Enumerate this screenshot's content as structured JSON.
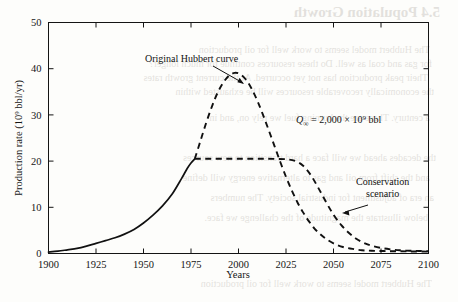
{
  "page": {
    "width": 458,
    "height": 302,
    "background_color": "#fdfdfb",
    "ink_color": "#121212"
  },
  "bleed_through": {
    "description": "faint mirrored text showing through from the opposite page of the scanned book",
    "heading": "5.4  Population Growth",
    "lines": [
      "The Hubbert model seems to work well for oil production",
      "for gas and coal as well. Do these resources continue for much longer?",
      "Their peak production has not yet occurred. At the current growth rates",
      "the economically recoverable resources will be exhausted within",
      "a century. These are the burning fuel we rely on, and in",
      "the decades ahead we will face a hard transition to new sources",
      "and the shift from oil and gas to alternative energy will define",
      "an era of adjustment for industrial society. The numbers",
      "below illustrate the magnitude of the challenge we face."
    ]
  },
  "chart_data": {
    "type": "line",
    "title": "",
    "xlabel": "Years",
    "ylabel": "Production rate (10⁹ bbl/yr)",
    "ylabel_parts": {
      "prefix": "Production rate (10",
      "exponent": "9",
      "suffix": " bbl/yr)"
    },
    "xlim": [
      1900,
      2100
    ],
    "ylim": [
      0,
      50
    ],
    "xticks": [
      1900,
      1925,
      1950,
      1975,
      2000,
      2025,
      2050,
      2075,
      2100
    ],
    "yticks": [
      0,
      10,
      20,
      30,
      40,
      50
    ],
    "grid": false,
    "legend_position": "inline-annotations",
    "annotations": [
      {
        "name": "original-hubbert-curve-label",
        "text": "Original Hubbert curve",
        "x_px": 145,
        "y_px": 62,
        "leader_to_px": [
          244,
          84
        ]
      },
      {
        "name": "conservation-scenario-label",
        "line1": "Conservation",
        "line2": "scenario",
        "x_px": 356,
        "y_px": 185,
        "leader_to_px": [
          343,
          208
        ]
      },
      {
        "name": "ultimate-recoverable-resource",
        "symbol": "Q",
        "subscript": "∞",
        "equals": "=",
        "value": "2,000",
        "times": "×",
        "base": "10",
        "exponent": "9",
        "unit": "bbl",
        "full_text": "Q∞ = 2,000 × 10⁹ bbl",
        "x_px": 296,
        "y_px": 122
      }
    ],
    "series": [
      {
        "name": "Historical production",
        "style": "solid",
        "color": "#111111",
        "points": [
          [
            1900,
            0.3
          ],
          [
            1905,
            0.5
          ],
          [
            1910,
            0.8
          ],
          [
            1915,
            1.1
          ],
          [
            1920,
            1.6
          ],
          [
            1925,
            2.2
          ],
          [
            1930,
            2.8
          ],
          [
            1935,
            3.4
          ],
          [
            1940,
            4.2
          ],
          [
            1945,
            5.2
          ],
          [
            1950,
            6.6
          ],
          [
            1955,
            8.3
          ],
          [
            1960,
            10.3
          ],
          [
            1965,
            12.8
          ],
          [
            1970,
            16.2
          ],
          [
            1973,
            18.4
          ],
          [
            1975,
            19.6
          ],
          [
            1977,
            20.5
          ]
        ]
      },
      {
        "name": "Original Hubbert curve",
        "style": "dashed",
        "color": "#111111",
        "points": [
          [
            1977,
            20.5
          ],
          [
            1980,
            24.4
          ],
          [
            1983,
            28.3
          ],
          [
            1986,
            31.8
          ],
          [
            1989,
            34.8
          ],
          [
            1992,
            37.0
          ],
          [
            1995,
            38.5
          ],
          [
            1998,
            39.1
          ],
          [
            2001,
            38.8
          ],
          [
            2004,
            37.6
          ],
          [
            2007,
            35.6
          ],
          [
            2010,
            33.0
          ],
          [
            2013,
            29.9
          ],
          [
            2016,
            26.6
          ],
          [
            2019,
            23.2
          ],
          [
            2022,
            19.8
          ],
          [
            2025,
            16.6
          ],
          [
            2028,
            13.7
          ],
          [
            2031,
            11.1
          ],
          [
            2034,
            8.9
          ],
          [
            2037,
            7.0
          ],
          [
            2040,
            5.4
          ],
          [
            2043,
            4.2
          ],
          [
            2046,
            3.2
          ],
          [
            2050,
            2.2
          ],
          [
            2055,
            1.4
          ],
          [
            2060,
            1.0
          ],
          [
            2065,
            0.7
          ],
          [
            2070,
            0.6
          ],
          [
            2080,
            0.5
          ],
          [
            2090,
            0.45
          ],
          [
            2100,
            0.4
          ]
        ]
      },
      {
        "name": "Conservation scenario",
        "style": "dashed",
        "color": "#111111",
        "points": [
          [
            1977,
            20.5
          ],
          [
            1985,
            20.5
          ],
          [
            1995,
            20.5
          ],
          [
            2005,
            20.5
          ],
          [
            2015,
            20.5
          ],
          [
            2025,
            20.4
          ],
          [
            2030,
            20.0
          ],
          [
            2034,
            19.0
          ],
          [
            2038,
            17.0
          ],
          [
            2042,
            14.2
          ],
          [
            2046,
            11.2
          ],
          [
            2050,
            8.4
          ],
          [
            2054,
            6.2
          ],
          [
            2058,
            4.5
          ],
          [
            2062,
            3.2
          ],
          [
            2066,
            2.3
          ],
          [
            2070,
            1.7
          ],
          [
            2075,
            1.2
          ],
          [
            2080,
            0.9
          ],
          [
            2085,
            0.7
          ],
          [
            2090,
            0.6
          ],
          [
            2095,
            0.55
          ],
          [
            2100,
            0.5
          ]
        ]
      }
    ]
  }
}
